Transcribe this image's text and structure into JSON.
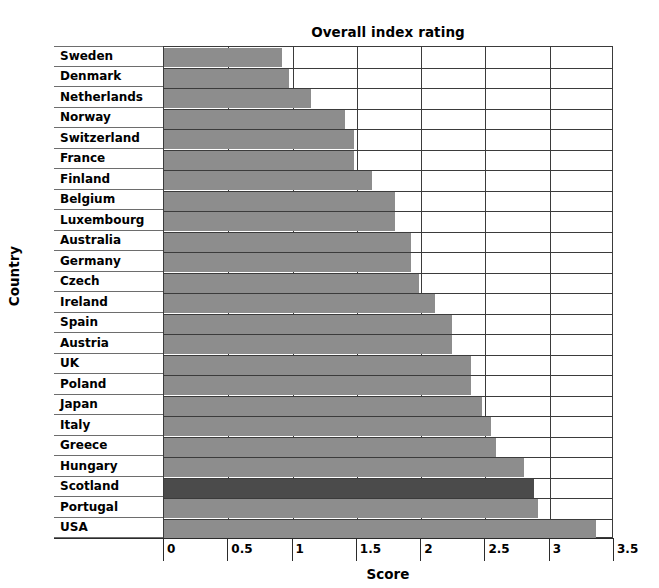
{
  "chart_data": {
    "type": "bar",
    "orientation": "horizontal",
    "title": "Overall index rating",
    "xlabel": "Score",
    "ylabel": "Country",
    "xlim": [
      0,
      3.5
    ],
    "xticks": [
      "0",
      "0.5",
      "1",
      "1.5",
      "2",
      "2.5",
      "3",
      "3.5"
    ],
    "xtick_values": [
      0,
      0.5,
      1,
      1.5,
      2,
      2.5,
      3,
      3.5
    ],
    "grid": true,
    "legend": null,
    "categories": [
      "Sweden",
      "Denmark",
      "Netherlands",
      "Norway",
      "Switzerland",
      "France",
      "Finland",
      "Belgium",
      "Luxembourg",
      "Australia",
      "Germany",
      "Czech",
      "Ireland",
      "Spain",
      "Austria",
      "UK",
      "Poland",
      "Japan",
      "Italy",
      "Greece",
      "Hungary",
      "Scotland",
      "Portugal",
      "USA"
    ],
    "values": [
      0.92,
      0.97,
      1.14,
      1.41,
      1.48,
      1.48,
      1.62,
      1.8,
      1.8,
      1.92,
      1.92,
      1.98,
      2.11,
      2.24,
      2.24,
      2.39,
      2.39,
      2.47,
      2.54,
      2.58,
      2.8,
      2.88,
      2.91,
      3.36
    ],
    "highlight_category": "Scotland",
    "colors": {
      "bar": "#8d8d8d",
      "bar_highlight": "#4b4b4b",
      "grid": "#3b3b3b",
      "text": "#000000",
      "background": "#ffffff"
    }
  }
}
